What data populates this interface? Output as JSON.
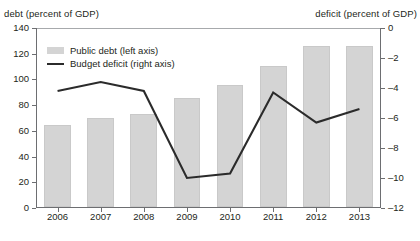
{
  "axes": {
    "left_caption": "debt (percent of GDP)",
    "right_caption": "deficit (percent of GDP)",
    "left_ticks": [
      "140",
      "120",
      "100",
      "80",
      "60",
      "40",
      "20",
      "0"
    ],
    "right_ticks": [
      "0",
      "–2",
      "–4",
      "–6",
      "–8",
      "–10",
      "–12"
    ]
  },
  "legend": {
    "items": [
      {
        "label": "Public debt (left axis)",
        "marker": "bar-swatch",
        "color": "#d4d4d4"
      },
      {
        "label": "Budget deficit (right axis)",
        "marker": "line-swatch",
        "color": "#2b2b2b"
      }
    ]
  },
  "chart_data": {
    "type": "bar",
    "title": "",
    "subtitle": "",
    "xlabel": "",
    "ylabel": "debt (percent of GDP)",
    "y2label": "deficit (percent of GDP)",
    "grid": false,
    "legend_position": "upper-left-inside",
    "categories": [
      "2006",
      "2007",
      "2008",
      "2009",
      "2010",
      "2011",
      "2012",
      "2013"
    ],
    "ylim": [
      0,
      140
    ],
    "y2lim": [
      -12,
      0
    ],
    "yticks": [
      0,
      20,
      40,
      60,
      80,
      100,
      120,
      140
    ],
    "y2ticks": [
      0,
      -2,
      -4,
      -6,
      -8,
      -10,
      -12
    ],
    "series": [
      {
        "name": "Public debt (left axis)",
        "type": "bar",
        "axis": "left",
        "color": "#d4d4d4",
        "values": [
          64,
          69,
          72,
          85,
          95,
          110,
          125,
          125
        ]
      },
      {
        "name": "Budget deficit (right axis)",
        "type": "line",
        "axis": "right",
        "color": "#2b2b2b",
        "values": [
          -4.2,
          -3.6,
          -4.2,
          -10.0,
          -9.7,
          -4.3,
          -6.3,
          -5.4
        ]
      }
    ]
  }
}
